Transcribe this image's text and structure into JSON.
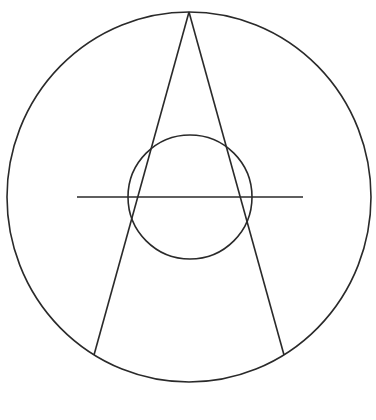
{
  "diagram": {
    "type": "geometry",
    "stroke_color": "#2a2a2a",
    "background": "#ffffff",
    "outer_circle": {
      "cx": 189,
      "cy": 197,
      "rx": 182,
      "ry": 185
    },
    "inner_circle": {
      "cx": 190,
      "cy": 197,
      "r": 62
    },
    "apex": {
      "x": 189,
      "y": 12
    },
    "left_line_end": {
      "x": 94,
      "y": 355
    },
    "right_line_end": {
      "x": 284,
      "y": 355
    },
    "horizontal_line": {
      "x1": 77,
      "y1": 197,
      "x2": 303,
      "y2": 197
    },
    "caption": ""
  }
}
